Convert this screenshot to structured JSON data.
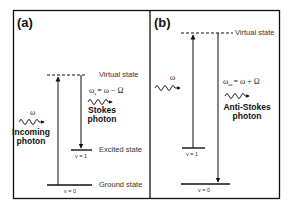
{
  "figure": {
    "panels": [
      {
        "tag": "(a)",
        "title": "Stokes Raman scattering",
        "virtual_state_label": "Virtual state",
        "excited_state_label": "Excited state",
        "ground_state_label": "Ground state",
        "v1_label": "v = 1",
        "v0_label": "v = 0",
        "incoming_omega": "ω",
        "incoming_label_line1": "Incoming",
        "incoming_label_line2": "photon",
        "scattered_formula": "ωs = ω − Ω",
        "scattered_formula_main": "ω",
        "scattered_formula_sub": "s",
        "scattered_formula_rest": "= ω − Ω",
        "scattered_label_line1": "Stokes",
        "scattered_label_line2": "photon"
      },
      {
        "tag": "(b)",
        "title": "Anti-Stokes Raman scattering",
        "virtual_state_label": "Virtual state",
        "v1_label": "v = 1",
        "v0_label": "v = 0",
        "incoming_omega": "ω",
        "scattered_formula": "ωas = ω + Ω",
        "scattered_formula_main": "ω",
        "scattered_formula_sub": "as",
        "scattered_formula_rest": "= ω + Ω",
        "scattered_label_line1": "Anti-Stokes",
        "scattered_label_line2": "photon"
      }
    ],
    "colors": {
      "line": "#111111",
      "text": "#222222",
      "background": "#ffffff"
    }
  }
}
